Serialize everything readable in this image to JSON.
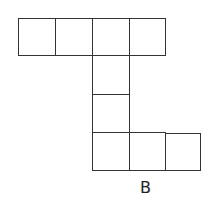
{
  "diagram": {
    "type": "cube net",
    "label": "B",
    "line_color": "#333333",
    "cell_size": 37,
    "cells": [
      {
        "row": 0,
        "col": 0
      },
      {
        "row": 0,
        "col": 1
      },
      {
        "row": 0,
        "col": 2
      },
      {
        "row": 0,
        "col": 3
      },
      {
        "row": 1,
        "col": 2
      },
      {
        "row": 2,
        "col": 2
      },
      {
        "row": 3,
        "col": 2
      },
      {
        "row": 3,
        "col": 3
      },
      {
        "row": 3,
        "col": 4
      }
    ]
  }
}
